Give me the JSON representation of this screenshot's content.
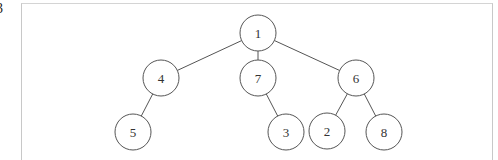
{
  "figure": {
    "partial_label": "3",
    "tree": {
      "nodes": [
        {
          "id": "n1",
          "label": "1"
        },
        {
          "id": "n4",
          "label": "4"
        },
        {
          "id": "n7",
          "label": "7"
        },
        {
          "id": "n6",
          "label": "6"
        },
        {
          "id": "n5",
          "label": "5"
        },
        {
          "id": "n3",
          "label": "3"
        },
        {
          "id": "n2",
          "label": "2"
        },
        {
          "id": "n8",
          "label": "8"
        }
      ],
      "edges": [
        {
          "from": "n1",
          "to": "n4"
        },
        {
          "from": "n1",
          "to": "n7"
        },
        {
          "from": "n1",
          "to": "n6"
        },
        {
          "from": "n4",
          "to": "n5"
        },
        {
          "from": "n7",
          "to": "n3"
        },
        {
          "from": "n6",
          "to": "n2"
        },
        {
          "from": "n6",
          "to": "n8"
        }
      ]
    }
  }
}
